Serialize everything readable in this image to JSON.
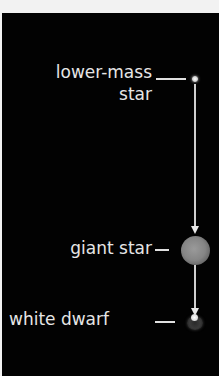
{
  "diagram": {
    "stages": [
      {
        "label_line1": "lower-mass",
        "label_line2": "star"
      },
      {
        "label": "giant star"
      },
      {
        "label": "white dwarf"
      }
    ],
    "colors": {
      "background": "#020202",
      "frame": "#f2f2f2",
      "text": "#e6e6e6",
      "lines": "#d0d0d0"
    }
  }
}
